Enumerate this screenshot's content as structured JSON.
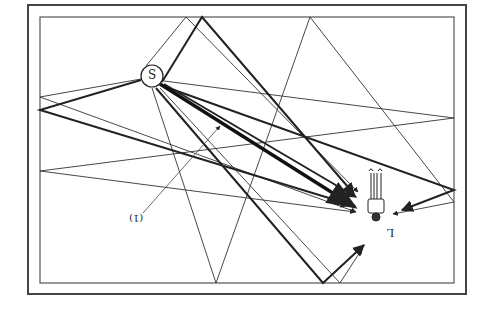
{
  "diagram": {
    "title": "",
    "source": {
      "label": "S",
      "x": 152,
      "y": 76,
      "r": 11
    },
    "annotation": {
      "label": "(1)",
      "pointer": {
        "from": [
          143,
          213
        ],
        "to": [
          220,
          126
        ]
      }
    },
    "listener": {
      "label": "L",
      "x": 375,
      "y": 205
    },
    "frame": {
      "outer": {
        "x": 28,
        "y": 5,
        "w": 438,
        "h": 289
      },
      "inner": {
        "x": 40,
        "y": 17,
        "w": 414,
        "h": 266
      }
    },
    "colors": {
      "line": "#222222",
      "frame": "#444444",
      "background": "#ffffff"
    },
    "rays": {
      "direct": {
        "from": [
          160,
          84
        ],
        "to": [
          355,
          207
        ],
        "weight": "heavy"
      },
      "thick": [
        {
          "points": [
            [
              162,
              82
            ],
            [
              202,
              17
            ],
            [
              354,
              194
            ]
          ]
        },
        {
          "points": [
            [
              141,
              80
            ],
            [
              40,
              110
            ],
            [
              352,
              205
            ]
          ]
        },
        {
          "points": [
            [
              163,
              86
            ],
            [
              454,
              190
            ],
            [
              402,
              210
            ]
          ]
        },
        {
          "points": [
            [
              156,
              88
            ],
            [
              323,
              283
            ],
            [
              364,
              245
            ]
          ]
        },
        {
          "points": [
            [
              164,
              84
            ],
            [
              356,
              197
            ]
          ]
        }
      ],
      "thin": [
        {
          "points": [
            [
              146,
              66
            ],
            [
              186,
              17
            ],
            [
              358,
              192
            ]
          ]
        },
        {
          "points": [
            [
              141,
              79
            ],
            [
              40,
              97
            ],
            [
              356,
              212
            ]
          ]
        },
        {
          "points": [
            [
              164,
              81
            ],
            [
              454,
              118
            ],
            [
              40,
              171
            ],
            [
              355,
              212
            ]
          ]
        },
        {
          "points": [
            [
              152,
              88
            ],
            [
              216,
              283
            ],
            [
              310,
              17
            ],
            [
              454,
              202
            ],
            [
              393,
              214
            ]
          ]
        },
        {
          "points": [
            [
              160,
              88
            ],
            [
              340,
              283
            ],
            [
              362,
              249
            ]
          ]
        }
      ]
    }
  }
}
